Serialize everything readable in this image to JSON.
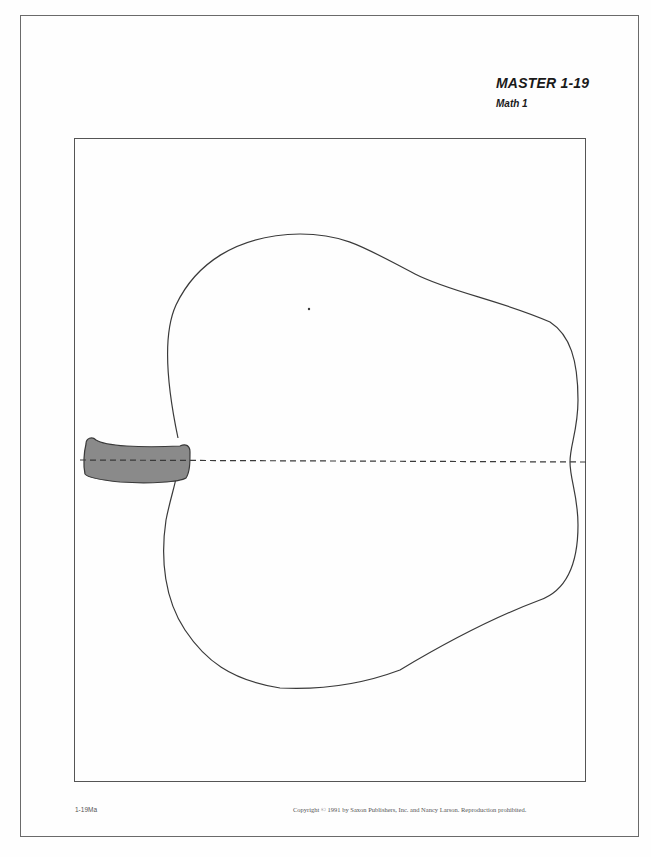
{
  "header": {
    "title": "MASTER 1-19",
    "subtitle": "Math 1"
  },
  "worksheet": {
    "figure": "apple-outline",
    "figure_parts": [
      "apple-body-outline",
      "stem",
      "dashed-center-line",
      "center-dot"
    ],
    "colors": {
      "outline": "#3a3a3a",
      "stem_fill": "#8a8a8a",
      "border": "#555555"
    }
  },
  "footer": {
    "code": "1-19Ma",
    "copyright": "Copyright © 1991 by Saxon Publishers, Inc. and Nancy Larson. Reproduction prohibited."
  }
}
